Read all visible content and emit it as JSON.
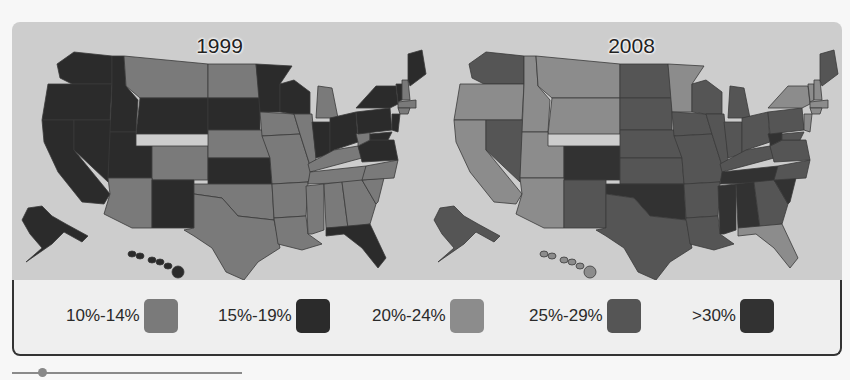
{
  "chart_data": {
    "type": "choropleth",
    "maps": [
      {
        "title": "1999",
        "states": {
          "WA": "15%-19%",
          "OR": "15%-19%",
          "CA": "15%-19%",
          "NV": "15%-19%",
          "ID": "15%-19%",
          "MT": "10%-14%",
          "WY": "15%-19%",
          "UT": "15%-19%",
          "AZ": "10%-14%",
          "CO": "10%-14%",
          "NM": "15%-19%",
          "ND": "10%-14%",
          "SD": "15%-19%",
          "NE": "10%-14%",
          "KS": "15%-19%",
          "OK": "10%-14%",
          "TX": "10%-14%",
          "MN": "15%-19%",
          "IA": "10%-14%",
          "MO": "10%-14%",
          "AR": "10%-14%",
          "LA": "10%-14%",
          "WI": "15%-19%",
          "IL": "10%-14%",
          "MI": "10%-14%",
          "IN": "15%-19%",
          "OH": "15%-19%",
          "KY": "10%-14%",
          "TN": "10%-14%",
          "MS": "10%-14%",
          "AL": "10%-14%",
          "GA": "10%-14%",
          "FL": "15%-19%",
          "SC": "10%-14%",
          "NC": "10%-14%",
          "VA": "15%-19%",
          "WV": "10%-14%",
          "PA": "15%-19%",
          "NY": "15%-19%",
          "VT": "15%-19%",
          "NH": "10%-14%",
          "ME": "15%-19%",
          "MA": "10%-14%",
          "CT": "10%-14%",
          "NJ": "15%-19%",
          "MD": "15%-19%",
          "AK": "15%-19%",
          "HI": "15%-19%"
        }
      },
      {
        "title": "2008",
        "states": {
          "WA": "25%-29%",
          "OR": "20%-24%",
          "CA": "20%-24%",
          "NV": "25%-29%",
          "ID": "20%-24%",
          "MT": "20%-24%",
          "WY": "20%-24%",
          "UT": "20%-24%",
          "AZ": "20%-24%",
          "CO": ">30%",
          "NM": "25%-29%",
          "ND": "25%-29%",
          "SD": "25%-29%",
          "NE": "25%-29%",
          "KS": "25%-29%",
          "OK": ">30%",
          "TX": "25%-29%",
          "MN": "20%-24%",
          "IA": "25%-29%",
          "MO": "25%-29%",
          "AR": "25%-29%",
          "LA": "25%-29%",
          "WI": "25%-29%",
          "IL": "25%-29%",
          "MI": "25%-29%",
          "IN": "25%-29%",
          "OH": "25%-29%",
          "KY": "25%-29%",
          "TN": ">30%",
          "MS": ">30%",
          "AL": ">30%",
          "GA": "25%-29%",
          "FL": "20%-24%",
          "SC": ">30%",
          "NC": "25%-29%",
          "VA": "25%-29%",
          "WV": ">30%",
          "PA": "25%-29%",
          "NY": "20%-24%",
          "VT": "20%-24%",
          "NH": "20%-24%",
          "ME": "25%-29%",
          "MA": "20%-24%",
          "CT": "20%-24%",
          "NJ": "20%-24%",
          "MD": "25%-29%",
          "AK": "25%-29%",
          "HI": "20%-24%"
        }
      }
    ],
    "legend": [
      {
        "label": "10%-14%",
        "color": "#7a7a7a"
      },
      {
        "label": "15%-19%",
        "color": "#2b2b2b"
      },
      {
        "label": "20%-24%",
        "color": "#8c8c8c"
      },
      {
        "label": "25%-29%",
        "color": "#555555"
      },
      {
        "label": ">30%",
        "color": "#323232"
      }
    ]
  },
  "maps": [
    {
      "title": "1999"
    },
    {
      "title": "2008"
    }
  ],
  "legend": {
    "items": [
      {
        "label": "10%-14%",
        "color": "#7a7a7a"
      },
      {
        "label": "15%-19%",
        "color": "#2b2b2b"
      },
      {
        "label": "20%-24%",
        "color": "#8c8c8c"
      },
      {
        "label": "25%-29%",
        "color": "#555555"
      },
      {
        "label": ">30%",
        "color": "#323232"
      }
    ]
  },
  "slider": {
    "value_fraction": 0.13
  }
}
